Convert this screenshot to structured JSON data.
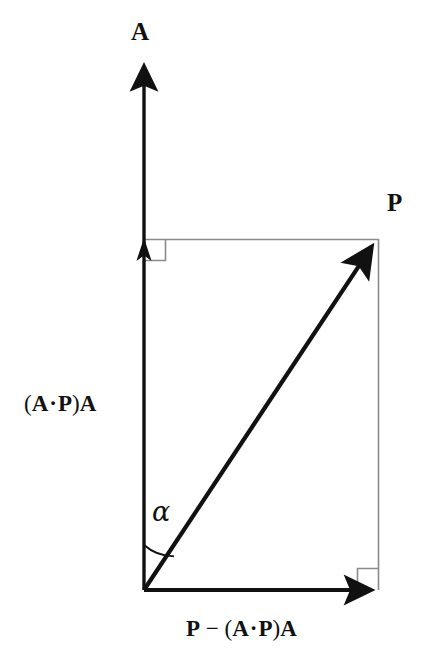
{
  "figure": {
    "type": "vector-projection-diagram",
    "background_color": "#ffffff",
    "stroke_color": "#111111",
    "guide_color": "#8a8a8a"
  },
  "labels": {
    "axis_a": "A",
    "point_p": "P",
    "projection_component": "(A · P)A",
    "projection_component_parts": {
      "open_paren": "(",
      "a1": "A",
      "dot": "·",
      "p1": "P",
      "close_paren": ")",
      "a2": "A"
    },
    "rejection_component": "P − (A · P)A",
    "rejection_component_parts": {
      "p_lead": "P",
      "minus": "−",
      "open_paren": "(",
      "a1": "A",
      "dot": "·",
      "p1": "P",
      "close_paren": ")",
      "a2": "A"
    },
    "angle": "α"
  },
  "geometry": {
    "origin": {
      "x": 144,
      "y": 590
    },
    "axis_tip": {
      "x": 144,
      "y": 60
    },
    "projection_tip": {
      "x": 144,
      "y": 239
    },
    "p_point": {
      "x": 379,
      "y": 239
    },
    "horizontal_tip": {
      "x": 379,
      "y": 590
    },
    "angle_arc_radius": 45,
    "right_angle_marker_size": 21
  },
  "elements": {
    "a_vector_name": "a-unit-vector-arrow",
    "projection_arrow_name": "projection-arrow",
    "p_vector_name": "p-vector-arrow",
    "rejection_arrow_name": "rejection-arrow",
    "right_angle_top_name": "right-angle-marker-top-left",
    "right_angle_bottom_name": "right-angle-marker-bottom-right",
    "guide_top_name": "guide-line-top",
    "guide_right_name": "guide-line-right",
    "angle_arc_name": "angle-arc"
  }
}
